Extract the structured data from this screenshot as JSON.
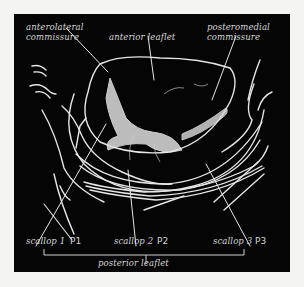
{
  "figure": {
    "colors": {
      "background": "#f4f4f2",
      "panel": "#050505",
      "line": "#e6e6e6",
      "label": "#d8d8d8"
    }
  },
  "labels": {
    "anterolateral_commissure": "anterolateral\ncommissure",
    "anterior_leaflet": "anterior leaflet",
    "posteromedial_commissure": "posteromedial\ncommissure",
    "scallop1": "scallop 1",
    "p1": "P1",
    "scallop2": "scallop 2",
    "p2": "P2",
    "scallop3": "scallop 3",
    "p3": "P3",
    "posterior_leaflet": "posterior leaflet"
  }
}
